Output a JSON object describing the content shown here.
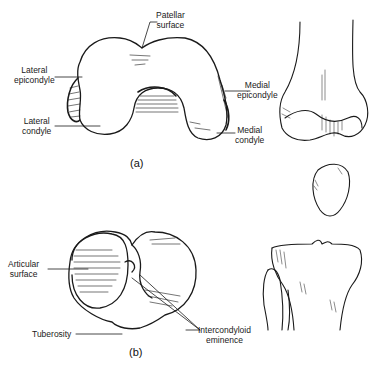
{
  "figure": {
    "panel_a": {
      "caption": "(a)",
      "labels": {
        "patellar_surface": [
          "Patellar",
          "surface"
        ],
        "lateral_epicondyle": [
          "Lateral",
          "epicondyle"
        ],
        "lateral_condyle": [
          "Lateral",
          "condyle"
        ],
        "medial_epicondyle": [
          "Medial",
          "epicondyle"
        ],
        "medial_condyle": [
          "Medial",
          "condyle"
        ]
      }
    },
    "panel_b": {
      "caption": "(b)",
      "labels": {
        "articular_surface": [
          "Articular",
          "surface"
        ],
        "tuberosity": [
          "Tuberosity"
        ],
        "intercondyloid_eminence": [
          "Intercondyloid",
          "eminence"
        ]
      }
    },
    "right_column": {
      "views": [
        "femur-distal-anterior",
        "patella",
        "tibia-proximal-anterior"
      ]
    },
    "colors": {
      "line": "#1a1a1a",
      "background": "#ffffff"
    }
  }
}
